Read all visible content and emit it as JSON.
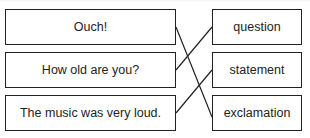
{
  "left_items": [
    {
      "label": "Ouch!"
    },
    {
      "label": "How old are you?"
    },
    {
      "label": "The music was very loud."
    }
  ],
  "right_items": [
    {
      "label": "question"
    },
    {
      "label": "statement"
    },
    {
      "label": "exclamation"
    }
  ],
  "matches": [
    {
      "from": "Ouch!",
      "to": "exclamation"
    },
    {
      "from": "How old are you?",
      "to": "question"
    },
    {
      "from": "The music was very loud.",
      "to": "statement"
    }
  ]
}
